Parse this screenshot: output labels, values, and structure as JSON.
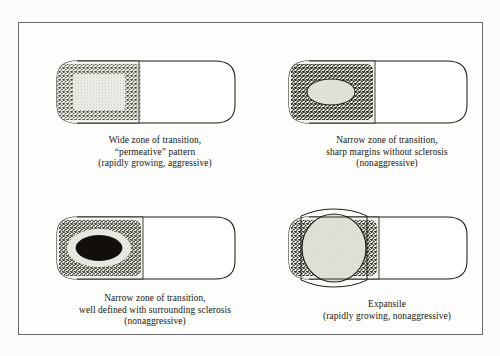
{
  "figure": {
    "ink_color": "#17170f",
    "frame_color": "#6b6b6b",
    "page_color": "#fdfdfc",
    "panels": [
      {
        "id": "wide-zone-permeative",
        "position": "top-left",
        "lesion_type": "permeative",
        "lesion_fill": "light-gray-stipple",
        "margin": "wide zone of transition",
        "caption_lines": [
          "Wide zone of transition,",
          "“permeative” pattern",
          "(rapidly growing, aggressive)"
        ]
      },
      {
        "id": "narrow-zone-no-sclerosis",
        "position": "top-right",
        "lesion_type": "geographic without sclerosis",
        "lesion_fill": "light-gray-oval",
        "margin": "narrow zone of transition, sharp margins",
        "caption_lines": [
          "Narrow zone of transition,",
          "sharp margins without sclerosis",
          "(nonaggressive)"
        ]
      },
      {
        "id": "narrow-zone-with-sclerosis",
        "position": "bottom-left",
        "lesion_type": "geographic with sclerotic rim",
        "lesion_fill": "dark-oval",
        "margin": "narrow zone of transition, sclerotic border",
        "caption_lines": [
          "Narrow zone of transition,",
          "well defined with surrounding sclerosis",
          "(nonaggressive)"
        ]
      },
      {
        "id": "expansile",
        "position": "bottom-right",
        "lesion_type": "expansile",
        "lesion_fill": "large-light-gray-circle",
        "margin": "expanded cortical contour",
        "caption_lines": [
          "Expansile",
          "(rapidly growing, nonaggressive)"
        ]
      }
    ]
  }
}
